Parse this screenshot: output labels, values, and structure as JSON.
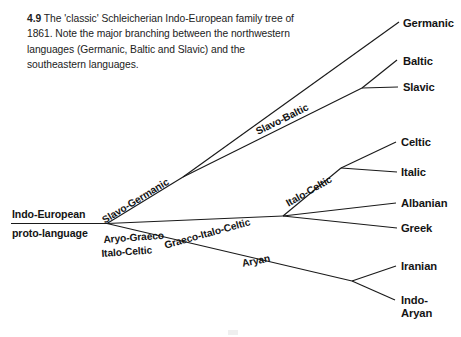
{
  "figure": {
    "number": "4.9",
    "caption": "The 'classic' Schleicherian Indo-European family tree of 1861. Note the major branching between the northwestern languages (Germanic, Baltic and Slavic) and the southeastern languages."
  },
  "diagram": {
    "root": {
      "line1": "Indo-European",
      "line2": "proto-language"
    },
    "branch_labels": [
      {
        "key": "slavo_germanic",
        "text": "Slavo-Germanic"
      },
      {
        "key": "slavo_baltic",
        "text": "Slavo-Baltic"
      },
      {
        "key": "aryo_graeco",
        "text": "Aryo-Graeco"
      },
      {
        "key": "italo_celtic_root",
        "text": "Italo-Celtic"
      },
      {
        "key": "graeco_italo_celtic",
        "text": "Graeco-Italo-Celtic"
      },
      {
        "key": "italo_celtic_upper",
        "text": "Italo-Celtic"
      },
      {
        "key": "aryan",
        "text": "Aryan"
      }
    ],
    "leaves": [
      {
        "key": "germanic",
        "text": "Germanic"
      },
      {
        "key": "baltic",
        "text": "Baltic"
      },
      {
        "key": "slavic",
        "text": "Slavic"
      },
      {
        "key": "celtic",
        "text": "Celtic"
      },
      {
        "key": "italic",
        "text": "Italic"
      },
      {
        "key": "albanian",
        "text": "Albanian"
      },
      {
        "key": "greek",
        "text": "Greek"
      },
      {
        "key": "iranian",
        "text": "Iranian"
      },
      {
        "key": "indo_aryan_line1",
        "text": "Indo-"
      },
      {
        "key": "indo_aryan_line2",
        "text": "Aryan"
      }
    ],
    "colors": {
      "ink": "#1a1a1a",
      "background": "#ffffff"
    }
  }
}
